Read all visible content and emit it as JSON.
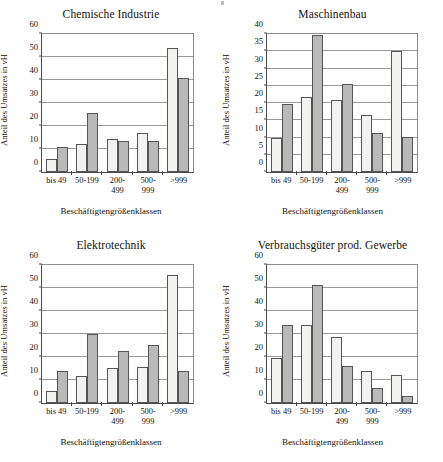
{
  "figure": {
    "axis_title_x": "Beschäftigtengrößenklassen",
    "axis_title_y": "Anteil des Umsatzes in vH",
    "series_names": [
      "Serie 1",
      "Serie 2"
    ],
    "colors": {
      "series1": "#f2f2f0",
      "series2": "#b9b9b9",
      "axis": "#4a4a4a",
      "grid": "#9a9a9a",
      "text": "#111111"
    }
  },
  "categories": [
    "bis 49",
    "50-199",
    "200-499",
    "500-999",
    ">999"
  ],
  "category_lines": [
    [
      "bis 49"
    ],
    [
      "50-199"
    ],
    [
      "200-",
      "499"
    ],
    [
      "500-",
      "999"
    ],
    [
      ">999"
    ]
  ],
  "chart_data": [
    {
      "type": "bar",
      "title": "Chemische Industrie",
      "xlabel": "Beschäftigtengrößenklassen",
      "ylabel": "Anteil des Umsatzes in vH",
      "categories": [
        "bis 49",
        "50-199",
        "200-499",
        "500-999",
        ">999"
      ],
      "series": [
        {
          "name": "Serie 1",
          "values": [
            5.5,
            12.3,
            14.2,
            17.0,
            54.0
          ]
        },
        {
          "name": "Serie 2",
          "values": [
            10.8,
            25.7,
            13.6,
            13.3,
            40.7
          ]
        }
      ],
      "ylim": [
        0,
        60
      ],
      "yticks": [
        0,
        10,
        20,
        30,
        40,
        50,
        60
      ],
      "grid": true,
      "legend": "none"
    },
    {
      "type": "bar",
      "title": "Maschinenbau",
      "xlabel": "Beschäftigtengrößenklassen",
      "ylabel": "Anteil des Umsatzes in vH",
      "categories": [
        "bis 49",
        "50-199",
        "200-499",
        "500-999",
        ">999"
      ],
      "series": [
        {
          "name": "Serie 1",
          "values": [
            9.8,
            21.6,
            20.9,
            16.5,
            35.0
          ]
        },
        {
          "name": "Serie 2",
          "values": [
            19.7,
            39.7,
            25.6,
            11.3,
            10.2
          ]
        }
      ],
      "ylim": [
        0,
        40
      ],
      "yticks": [
        0,
        5,
        10,
        15,
        20,
        25,
        30,
        35,
        40
      ],
      "grid": true,
      "legend": "none"
    },
    {
      "type": "bar",
      "title": "Elektrotechnik",
      "xlabel": "Beschäftigtengrößenklassen",
      "ylabel": "Anteil des Umsatzes in vH",
      "categories": [
        "bis 49",
        "50-199",
        "200-499",
        "500-999",
        ">999"
      ],
      "series": [
        {
          "name": "Serie 1",
          "values": [
            5.1,
            11.6,
            15.4,
            15.6,
            55.8
          ]
        },
        {
          "name": "Serie 2",
          "values": [
            13.9,
            29.8,
            22.6,
            25.4,
            14.1
          ]
        }
      ],
      "ylim": [
        0,
        60
      ],
      "yticks": [
        0,
        10,
        20,
        30,
        40,
        50,
        60
      ],
      "grid": true,
      "legend": "none"
    },
    {
      "type": "bar",
      "title": "Verbrauchsgüter prod. Gewerbe",
      "xlabel": "Beschäftigtengrößenklassen",
      "ylabel": "Anteil des Umsatzes in vH",
      "categories": [
        "bis 49",
        "50-199",
        "200-499",
        "500-999",
        ">999"
      ],
      "series": [
        {
          "name": "Serie 1",
          "values": [
            19.7,
            34.0,
            28.5,
            13.9,
            12.0
          ]
        },
        {
          "name": "Serie 2",
          "values": [
            34.0,
            51.2,
            16.0,
            6.6,
            3.0
          ]
        }
      ],
      "ylim": [
        0,
        60
      ],
      "yticks": [
        0,
        10,
        20,
        30,
        40,
        50,
        60
      ],
      "grid": true,
      "legend": "none"
    }
  ]
}
